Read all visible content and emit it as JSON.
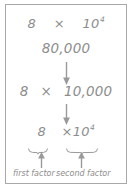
{
  "diagram": {
    "colors": {
      "text": "#8d8d8d",
      "border": "#a8a8a8",
      "arrow": "#9a9a9a",
      "background": "#ffffff"
    },
    "rows": {
      "expanded_notation": {
        "coefficient": "8",
        "operator": "×",
        "base": "10",
        "exponent": "4"
      },
      "product": {
        "value": "80,000"
      },
      "factored": {
        "coefficient": "8",
        "operator": "×",
        "value": "10,000"
      },
      "labeled": {
        "coefficient": "8",
        "operator": "×",
        "base": "10",
        "exponent": "4"
      }
    },
    "labels": {
      "first_factor": "first factor",
      "second_factor": "second factor"
    },
    "arrows": {
      "down_1": "arrow-down",
      "down_2": "arrow-down",
      "up_first": "arrow-up",
      "up_second": "arrow-up"
    }
  }
}
